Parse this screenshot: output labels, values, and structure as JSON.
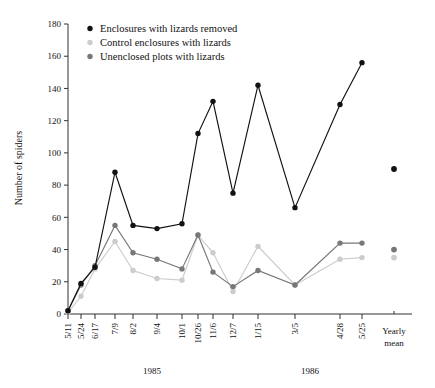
{
  "chart_data": {
    "type": "line",
    "title": "",
    "xlabel": "",
    "ylabel": "Number of spiders",
    "ylim": [
      0,
      180
    ],
    "yticks": [
      0,
      20,
      40,
      60,
      80,
      100,
      120,
      140,
      160,
      180
    ],
    "grid": false,
    "legend_position": "top-left",
    "categories": [
      "5/11",
      "5/24",
      "6/17",
      "7/9",
      "8/2",
      "9/4",
      "10/1",
      "10/26",
      "11/6",
      "12/7",
      "1/15",
      "3/5",
      "4/28",
      "5/25"
    ],
    "group_labels": [
      {
        "label": "1985",
        "spans": [
          "5/11",
          "12/7"
        ]
      },
      {
        "label": "1986",
        "spans": [
          "1/15",
          "5/25"
        ]
      }
    ],
    "yearly_mean_label": "Yearly\nmean",
    "yearly_mean_label_line1": "Yearly",
    "yearly_mean_label_line2": "mean",
    "series": [
      {
        "name": "Enclosures with lizards removed",
        "color": "#111111",
        "values": [
          2,
          19,
          29,
          88,
          55,
          53,
          56,
          112,
          132,
          75,
          142,
          66,
          130,
          156
        ],
        "yearly_mean": 90
      },
      {
        "name": "Control enclosures with lizards",
        "color": "#cccccc",
        "values": [
          1,
          11,
          28,
          45,
          27,
          22,
          21,
          49,
          38,
          14,
          42,
          18,
          34,
          35
        ],
        "yearly_mean": 35
      },
      {
        "name": "Unenclosed plots with lizards",
        "color": "#777777",
        "values": [
          2,
          18,
          30,
          55,
          38,
          34,
          28,
          49,
          26,
          17,
          27,
          18,
          44,
          44
        ],
        "yearly_mean": 40
      }
    ]
  },
  "legend": {
    "items": [
      {
        "label": "Enclosures with lizards removed",
        "color": "#111111"
      },
      {
        "label": "Control enclosures with lizards",
        "color": "#cccccc"
      },
      {
        "label": "Unenclosed plots with lizards",
        "color": "#777777"
      }
    ]
  },
  "axes": {
    "y_title": "Number of spiders",
    "y_ticks": [
      "0",
      "20",
      "40",
      "60",
      "80",
      "100",
      "120",
      "140",
      "160",
      "180"
    ],
    "x_ticks": [
      "5/11",
      "5/24",
      "6/17",
      "7/9",
      "8/2",
      "9/4",
      "10/1",
      "10/26",
      "11/6",
      "12/7",
      "1/15",
      "3/5",
      "4/28",
      "5/25"
    ],
    "x_groups": [
      "1985",
      "1986"
    ],
    "yearly_mean_line1": "Yearly",
    "yearly_mean_line2": "mean"
  }
}
